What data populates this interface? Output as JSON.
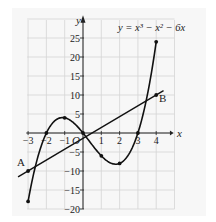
{
  "chart_data": {
    "type": "line",
    "title": "",
    "equation": "y = x³ − x² − 6x",
    "xlabel": "x",
    "ylabel": "y",
    "origin_label": "O",
    "xlim": [
      -3,
      5
    ],
    "ylim": [
      -20,
      30
    ],
    "xticks": [
      -3,
      -2,
      -1,
      1,
      2,
      3,
      4
    ],
    "yticks": [
      25,
      20,
      15,
      10,
      5,
      -5,
      -10,
      -15,
      -20
    ],
    "grid": true,
    "series": [
      {
        "name": "y = x³ − x² − 6x",
        "type": "curve",
        "points": [
          {
            "x": -3,
            "y": -18
          },
          {
            "x": -2,
            "y": 0
          },
          {
            "x": -1,
            "y": 4
          },
          {
            "x": 0,
            "y": 0
          },
          {
            "x": 1,
            "y": -6
          },
          {
            "x": 2,
            "y": -8
          },
          {
            "x": 3,
            "y": 0
          },
          {
            "x": 4,
            "y": 24
          }
        ]
      },
      {
        "name": "line AB",
        "type": "line",
        "points": [
          {
            "x": -3,
            "y": -10,
            "label": "A"
          },
          {
            "x": 4,
            "y": 10,
            "label": "B"
          }
        ]
      }
    ]
  },
  "labels": {
    "equation": "y = x³ − x² − 6x",
    "x_axis": "x",
    "y_axis": "y",
    "origin": "O",
    "point_a": "A",
    "point_b": "B"
  }
}
